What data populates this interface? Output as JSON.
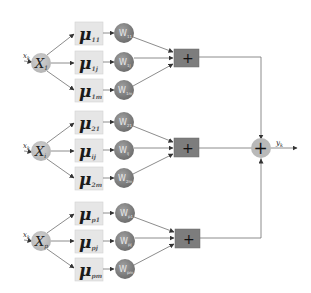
{
  "diagram": {
    "title": "",
    "groups": [
      {
        "input_label": "x",
        "input_sub": "k",
        "node_label": "X",
        "node_sub": "1",
        "mu": [
          {
            "symbol": "μ",
            "sub": "11"
          },
          {
            "symbol": "μ",
            "sub": "1j"
          },
          {
            "symbol": "μ",
            "sub": "1m"
          }
        ],
        "weights": [
          {
            "label": "W",
            "sub": "11"
          },
          {
            "label": "W",
            "sub": "1j"
          },
          {
            "label": "W",
            "sub": "1m"
          }
        ],
        "adder": "+"
      },
      {
        "input_label": "x",
        "input_sub": "k",
        "node_label": "X",
        "node_sub": "i",
        "mu": [
          {
            "symbol": "μ",
            "sub": "21"
          },
          {
            "symbol": "μ",
            "sub": "ij"
          },
          {
            "symbol": "μ",
            "sub": "2m"
          }
        ],
        "weights": [
          {
            "label": "W",
            "sub": "21"
          },
          {
            "label": "W",
            "sub": "ij"
          },
          {
            "label": "W",
            "sub": "2m"
          }
        ],
        "adder": "+"
      },
      {
        "input_label": "x",
        "input_sub": "k",
        "node_label": "X",
        "node_sub": "p",
        "mu": [
          {
            "symbol": "μ",
            "sub": "p1"
          },
          {
            "symbol": "μ",
            "sub": "pj"
          },
          {
            "symbol": "μ",
            "sub": "pm"
          }
        ],
        "weights": [
          {
            "label": "W",
            "sub": "p1"
          },
          {
            "label": "W",
            "sub": "pj"
          },
          {
            "label": "W",
            "sub": "pm"
          }
        ],
        "adder": "+"
      }
    ],
    "summation": "+",
    "output_label": "y",
    "output_sub": "k",
    "colors": {
      "mu_box": "#e6e6e6",
      "weight_node": "#8a8a8a",
      "input_node": "#c4c4c4",
      "adder_box": "#7d7d7d",
      "sum_node": "#b9b9b9",
      "lines": "#6f6f6f"
    }
  }
}
